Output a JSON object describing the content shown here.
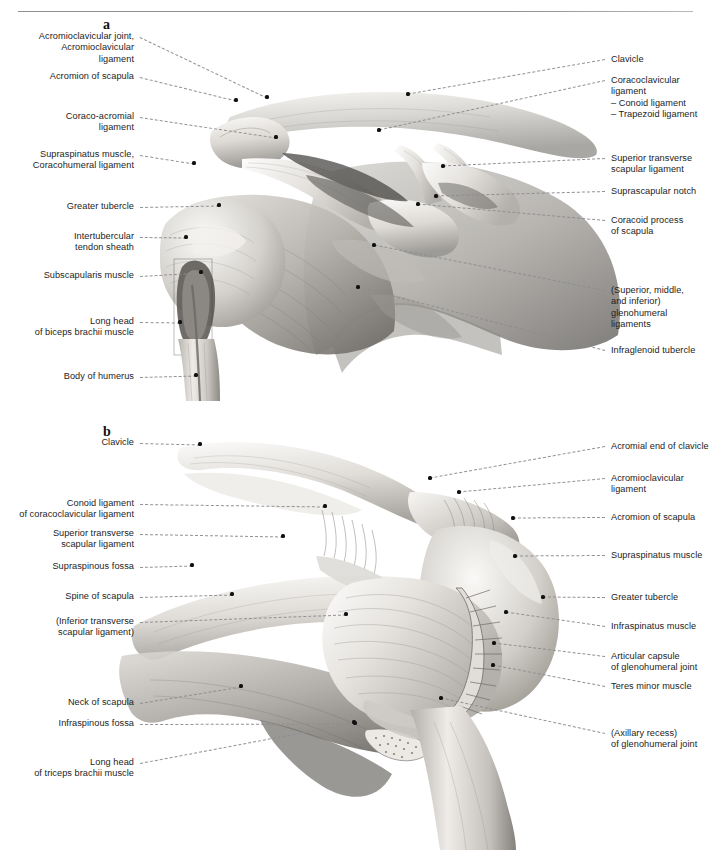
{
  "page": {
    "running_head": "",
    "background": "#ffffff",
    "rule_color": "#8e8e93",
    "text_color": "#1d1d1d",
    "leader_color": "#8d8d92",
    "dot_color": "#111111",
    "width": 711,
    "height": 859
  },
  "panels": [
    {
      "id": "a",
      "letter": "a",
      "letter_pos": {
        "x": 103,
        "y": 17
      },
      "labels_left": [
        {
          "name": "acromioclavicular-joint-ligament",
          "text": "Acromioclavicular joint,\nAcromioclavicular\nligament",
          "x": 18,
          "y": 31,
          "w": 116,
          "anchor": {
            "x": 267,
            "y": 97
          }
        },
        {
          "name": "acromion-of-scapula",
          "text": "Acromion of scapula",
          "x": 32,
          "y": 71,
          "w": 102,
          "anchor": {
            "x": 236,
            "y": 100
          }
        },
        {
          "name": "coraco-acromial-ligament",
          "text": "Coraco-acromial\nligament",
          "x": 40,
          "y": 111,
          "w": 94,
          "anchor": {
            "x": 276,
            "y": 137
          }
        },
        {
          "name": "supraspinatus-muscle-coracohumeral-ligament",
          "text": "Supraspinatus muscle,\nCoracohumeral ligament",
          "x": 18,
          "y": 149,
          "w": 116,
          "anchor": {
            "x": 194,
            "y": 163
          }
        },
        {
          "name": "greater-tubercle",
          "text": "Greater tubercle",
          "x": 48,
          "y": 201,
          "w": 86,
          "anchor": {
            "x": 219,
            "y": 205
          }
        },
        {
          "name": "intertubercular-tendon-sheath",
          "text": "Intertubercular\ntendon sheath",
          "x": 44,
          "y": 231,
          "w": 90,
          "anchor": {
            "x": 186,
            "y": 237
          }
        },
        {
          "name": "subscapularis-muscle",
          "text": "Subscapularis muscle",
          "x": 30,
          "y": 270,
          "w": 104,
          "anchor": {
            "x": 201,
            "y": 272
          }
        },
        {
          "name": "long-head-of-biceps-brachii-muscle",
          "text": "Long head\nof biceps brachii muscle",
          "x": 18,
          "y": 316,
          "w": 116,
          "anchor": {
            "x": 180,
            "y": 322
          }
        },
        {
          "name": "body-of-humerus",
          "text": "Body of humerus",
          "x": 46,
          "y": 371,
          "w": 88,
          "anchor": {
            "x": 196,
            "y": 375
          }
        }
      ],
      "labels_right": [
        {
          "name": "clavicle",
          "text": "Clavicle",
          "x": 611,
          "y": 54,
          "w": 98,
          "anchor": {
            "x": 408,
            "y": 94
          }
        },
        {
          "name": "coracoclavicular-ligament",
          "text": "Coracoclavicular ligament\n– Conoid ligament\n– Trapezoid ligament",
          "x": 611,
          "y": 75,
          "w": 98,
          "anchor": {
            "x": 379,
            "y": 130
          }
        },
        {
          "name": "superior-transverse-scapular-ligament",
          "text": "Superior transverse\nscapular ligament",
          "x": 611,
          "y": 153,
          "w": 98,
          "anchor": {
            "x": 443,
            "y": 166
          }
        },
        {
          "name": "suprascapular-notch",
          "text": "Suprascapular notch",
          "x": 611,
          "y": 186,
          "w": 98,
          "anchor": {
            "x": 436,
            "y": 196
          }
        },
        {
          "name": "coracoid-process-of-scapula",
          "text": "Coracoid process\nof scapula",
          "x": 611,
          "y": 215,
          "w": 98,
          "anchor": {
            "x": 418,
            "y": 204
          }
        },
        {
          "name": "glenohumeral-ligaments",
          "text": "(Superior, middle,\nand inferior)\nglenohumeral ligaments",
          "x": 611,
          "y": 285,
          "w": 98,
          "anchor": {
            "x": 374,
            "y": 245
          }
        },
        {
          "name": "infraglenoid-tubercle",
          "text": "Infraglenoid tubercle",
          "x": 611,
          "y": 345,
          "w": 98,
          "anchor": {
            "x": 358,
            "y": 287
          }
        }
      ]
    },
    {
      "id": "b",
      "letter": "b",
      "letter_pos": {
        "x": 103,
        "y": 424
      },
      "labels_left": [
        {
          "name": "clavicle-b",
          "text": "Clavicle",
          "x": 46,
          "y": 437,
          "w": 88,
          "anchor": {
            "x": 200,
            "y": 444
          }
        },
        {
          "name": "conoid-ligament-of-coracoclavicular-ligament",
          "text": "Conoid ligament\nof coracoclavicular ligament",
          "x": 10,
          "y": 498,
          "w": 124,
          "anchor": {
            "x": 325,
            "y": 506
          }
        },
        {
          "name": "superior-transverse-scapular-ligament-b",
          "text": "Superior transverse\nscapular ligament",
          "x": 34,
          "y": 528,
          "w": 100,
          "anchor": {
            "x": 283,
            "y": 536
          }
        },
        {
          "name": "supraspinous-fossa",
          "text": "Supraspinous fossa",
          "x": 42,
          "y": 561,
          "w": 92,
          "anchor": {
            "x": 192,
            "y": 565
          }
        },
        {
          "name": "spine-of-scapula",
          "text": "Spine of scapula",
          "x": 48,
          "y": 591,
          "w": 86,
          "anchor": {
            "x": 232,
            "y": 594
          }
        },
        {
          "name": "inferior-transverse-scapular-ligament",
          "text": "(Inferior transverse\nscapular ligament)",
          "x": 32,
          "y": 616,
          "w": 102,
          "anchor": {
            "x": 346,
            "y": 614
          }
        },
        {
          "name": "neck-of-scapula",
          "text": "Neck of scapula",
          "x": 48,
          "y": 697,
          "w": 86,
          "anchor": {
            "x": 241,
            "y": 686
          }
        },
        {
          "name": "infraspinous-fossa",
          "text": "Infraspinous fossa",
          "x": 44,
          "y": 718,
          "w": 90,
          "anchor": {
            "x": 355,
            "y": 723
          }
        },
        {
          "name": "long-head-of-triceps-brachii-muscle",
          "text": "Long head\nof triceps brachii muscle",
          "x": 14,
          "y": 757,
          "w": 120,
          "anchor": {
            "x": 354,
            "y": 722
          }
        }
      ],
      "labels_right": [
        {
          "name": "acromial-end-of-clavicle",
          "text": "Acromial end of clavicle",
          "x": 611,
          "y": 441,
          "w": 98,
          "anchor": {
            "x": 430,
            "y": 478
          }
        },
        {
          "name": "acromioclavicular-ligament-b",
          "text": "Acromioclavicular\nligament",
          "x": 611,
          "y": 473,
          "w": 98,
          "anchor": {
            "x": 459,
            "y": 492
          }
        },
        {
          "name": "acromion-of-scapula-b",
          "text": "Acromion of scapula",
          "x": 611,
          "y": 512,
          "w": 98,
          "anchor": {
            "x": 513,
            "y": 518
          }
        },
        {
          "name": "supraspinatus-muscle-b",
          "text": "Supraspinatus muscle",
          "x": 611,
          "y": 550,
          "w": 98,
          "anchor": {
            "x": 515,
            "y": 556
          }
        },
        {
          "name": "greater-tubercle-b",
          "text": "Greater tubercle",
          "x": 611,
          "y": 592,
          "w": 98,
          "anchor": {
            "x": 543,
            "y": 597
          }
        },
        {
          "name": "infraspinatus-muscle",
          "text": "Infraspinatus muscle",
          "x": 611,
          "y": 621,
          "w": 98,
          "anchor": {
            "x": 506,
            "y": 612
          }
        },
        {
          "name": "articular-capsule-of-glenohumeral-joint",
          "text": "Articular capsule\nof glenohumeral joint",
          "x": 611,
          "y": 651,
          "w": 98,
          "anchor": {
            "x": 494,
            "y": 643
          }
        },
        {
          "name": "teres-minor-muscle",
          "text": "Teres minor muscle",
          "x": 611,
          "y": 681,
          "w": 98,
          "anchor": {
            "x": 493,
            "y": 665
          }
        },
        {
          "name": "axillary-recess-of-glenohumeral-joint",
          "text": "(Axillary recess)\nof glenohumeral joint",
          "x": 611,
          "y": 728,
          "w": 98,
          "anchor": {
            "x": 441,
            "y": 698
          }
        }
      ]
    }
  ]
}
